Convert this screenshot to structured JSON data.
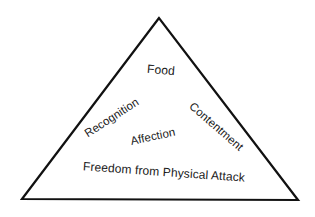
{
  "diagram": {
    "shape": "triangle",
    "stroke_color": "#111111",
    "background": "#ffffff",
    "labels": {
      "food": "Food",
      "recognition": "Recognition",
      "contentment": "Contentment",
      "affection": "Affection",
      "freedom": "Freedom from Physical Attack"
    }
  }
}
